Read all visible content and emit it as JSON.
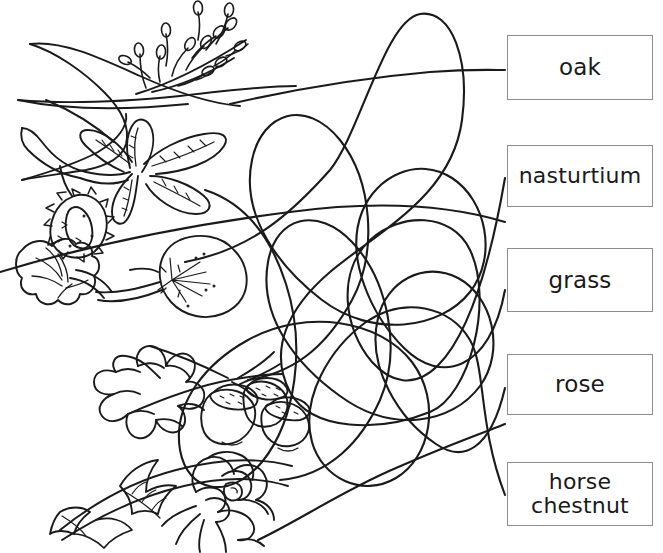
{
  "worksheet": {
    "type": "matching-activity",
    "description": "Line-art plant drawings on the left connected by tangled curved lines to word boxes on the right",
    "background_color": "#ffffff",
    "ink_color": "#1a1a1a",
    "box_border_color": "#8e8e8e"
  },
  "labels": [
    {
      "id": "oak",
      "text": "oak"
    },
    {
      "id": "nasturtium",
      "text": "nasturtium"
    },
    {
      "id": "grass",
      "text": "grass"
    },
    {
      "id": "rose",
      "text": "rose"
    },
    {
      "id": "horse_chestnut",
      "text": "horse\nchestnut"
    }
  ],
  "drawings": [
    {
      "id": "grass_plant",
      "name": "grass-drawing",
      "description": "long curved grass blade with a feathery seed head"
    },
    {
      "id": "horse_chestnut_plant",
      "name": "horse-chestnut-drawing",
      "description": "palmate compound leaf with a spiky conker case"
    },
    {
      "id": "nasturtium_plant",
      "name": "nasturtium-drawing",
      "description": "round peltate leaf with radiating veins and a flower"
    },
    {
      "id": "oak_plant",
      "name": "oak-drawing",
      "description": "lobed oak leaf with three acorns"
    },
    {
      "id": "rose_plant",
      "name": "rose-drawing",
      "description": "rose bloom with serrated leaves on a stem"
    }
  ],
  "connectors": {
    "count": 5,
    "style": "tangled curved lines crossing the centre of the page"
  }
}
